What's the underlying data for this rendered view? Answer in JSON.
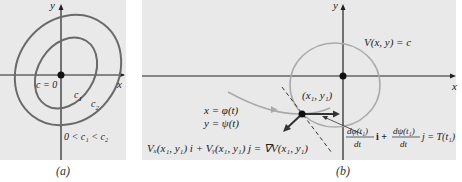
{
  "panels": {
    "a": {
      "caption": "(a)",
      "axis_x_label": "x",
      "axis_y_label": "y",
      "origin_label": "c = 0",
      "curve_inner_label": "c",
      "curve_inner_sub": "1",
      "curve_outer_label": "c",
      "curve_outer_sub": "2",
      "condition": "0 < c₁ < c₂"
    },
    "b": {
      "caption": "(b)",
      "axis_x_label": "x",
      "axis_y_label": "y",
      "level_curve_label": "V(x, y) = c",
      "point_label": "(x₁, y₁)",
      "param_x": "x = φ(t)",
      "param_y": "y = ψ(t)",
      "gradient_eq": "Vₓ(x₁, y₁) i + Vᵧ(x₁, y₁) j = ∇V(x₁, y₁)",
      "tangent_eq_num1": "dφ(t₁)",
      "tangent_eq_den1": "dt",
      "tangent_eq_i": "i +",
      "tangent_eq_num2": "dψ(t₁)",
      "tangent_eq_den2": "dt",
      "tangent_eq_rhs": "j = T(t₁)"
    }
  },
  "colors": {
    "background": "#e9e9e9",
    "axis": "#222222",
    "curve_dark": "#6a6a6a",
    "curve_light": "#aaaaaa",
    "text": "#222222"
  }
}
